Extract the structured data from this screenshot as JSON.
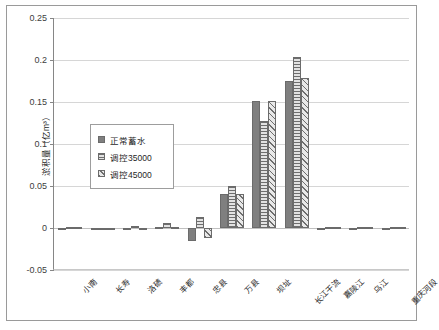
{
  "chart_data": {
    "type": "bar",
    "title": "",
    "xlabel": "",
    "ylabel": "淤积量（亿m³）",
    "ylim": [
      -0.05,
      0.25
    ],
    "ytick_labels": [
      "0.25",
      "0.2",
      "0.15",
      "0.1",
      "0.05",
      "0",
      "-0.05"
    ],
    "ytick_values": [
      0.25,
      0.2,
      0.15,
      0.1,
      0.05,
      0,
      -0.05
    ],
    "grid": true,
    "legend_position": "inside-left",
    "categories": [
      "小南",
      "长寿",
      "洛碛",
      "丰都",
      "忠县",
      "万县",
      "坝址",
      "长江干流",
      "嘉陵江",
      "乌江",
      "重庆河段"
    ],
    "series": [
      {
        "name": "正常蓄水",
        "values": [
          -0.001,
          -0.001,
          -0.002,
          0.001,
          -0.015,
          0.04,
          0.151,
          0.175,
          -0.001,
          -0.001,
          -0.001
        ]
      },
      {
        "name": "调控35000",
        "values": [
          0.0,
          -0.001,
          0.002,
          0.006,
          0.013,
          0.05,
          0.127,
          0.204,
          0.0,
          0.0,
          0.0
        ]
      },
      {
        "name": "调控45000",
        "values": [
          0.0,
          -0.001,
          -0.002,
          0.001,
          -0.012,
          0.041,
          0.151,
          0.179,
          0.0,
          0.0,
          0.0
        ]
      }
    ]
  },
  "legend": {
    "items": [
      {
        "label": "正常蓀水"
      },
      {
        "label": "调控35000"
      },
      {
        "label": "调控45000"
      }
    ]
  }
}
